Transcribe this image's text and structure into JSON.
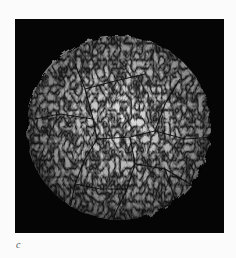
{
  "figure": {
    "panel_label": "c",
    "colors": {
      "background": "#050505",
      "page": "#fbfbfb",
      "highlight": "#f2f2f2",
      "shadow": "#1a1a1a",
      "crack": "#0c0c0c"
    }
  }
}
